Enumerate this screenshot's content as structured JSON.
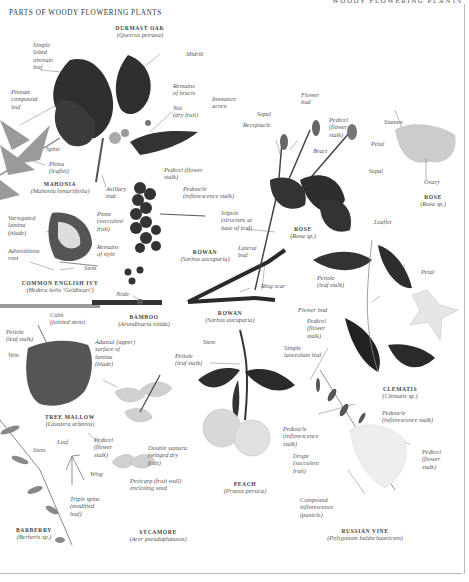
{
  "page": {
    "title": "PARTS OF WOODY FLOWERING PLANTS",
    "running_head": "WOODY FLOWERING PLANTS"
  },
  "specimens": [
    {
      "id": "oak",
      "name": "DURMAST OAK",
      "scientific": "(Quercus petraea)"
    },
    {
      "id": "mahonia",
      "name": "MAHONIA",
      "scientific": "(Mahonia lomariifolia)"
    },
    {
      "id": "ivy",
      "name": "COMMON ENGLISH IVY",
      "scientific": "(Hedera helix 'Goldheart')"
    },
    {
      "id": "bamboo",
      "name": "BAMBOO",
      "scientific": "(Arundinaria nitida)"
    },
    {
      "id": "rowan1",
      "name": "ROWAN",
      "scientific": "(Sorbus aucuparia)"
    },
    {
      "id": "rowan2",
      "name": "ROWAN",
      "scientific": "(Sorbus aucuparia)"
    },
    {
      "id": "rose1",
      "name": "ROSE",
      "scientific": "(Rosa sp.)"
    },
    {
      "id": "rose2",
      "name": "ROSE",
      "scientific": "(Rosa sp.)"
    },
    {
      "id": "mallow",
      "name": "TREE MALLOW",
      "scientific": "(Lavatera arborea)"
    },
    {
      "id": "sycamore",
      "name": "SYCAMORE",
      "scientific": "(Acer pseudoplatanus)"
    },
    {
      "id": "peach",
      "name": "PEACH",
      "scientific": "(Prunus persica)"
    },
    {
      "id": "clematis",
      "name": "CLEMATIS",
      "scientific": "(Clematis sp.)"
    },
    {
      "id": "barberry",
      "name": "BARBERRY",
      "scientific": "(Berberis sp.)"
    },
    {
      "id": "vine",
      "name": "RUSSIAN VINE",
      "scientific": "(Polygonum baldschuanicum)"
    }
  ],
  "labels": {
    "simple_lobed": "Simple\nlobed\nobovate\nleaf",
    "midrib": "Midrib",
    "remains_bracts": "Remains\nof bracts",
    "nut": "Nut\n(dry fruit)",
    "immature_acorn": "Immature\nacorn",
    "pinnate": "Pinnate\ncompound\nleaf",
    "spine": "Spine",
    "pinna": "Pinna\n(leaflet)",
    "axillary_bud": "Axillary\nbud",
    "pedicel_rowan": "Pedicel (flower\nstalk)",
    "peduncle_rowan": "Peduncle\n(inflorescence stalk)",
    "pome": "Pome\n(succulent\nfruit)",
    "remains_style": "Remains\nof style",
    "variegated": "Variegated\nlamina\n(blade)",
    "adventitious": "Adventitious\nroot",
    "stem_ivy": "Stem",
    "node": "Node",
    "culm": "Culm\n(jointed stem)",
    "stipule": "Stipule\n(structure at\nbase of leaf)",
    "sepal_rose": "Sepal",
    "receptacle": "Receptacle",
    "flower_bud_rose": "Flower\nbud",
    "pedicel_rose": "Pedicel\n(flower\nstalk)",
    "bract": "Bract",
    "leaflet": "Leaflet",
    "stamen": "Stamen",
    "petal_rose": "Petal",
    "sepal_rose2": "Sepal",
    "ovary": "Ovary",
    "lateral_bud": "Lateral\nbud",
    "ring_scar": "Ring scar",
    "petiole_clem": "Petiole\n(leaf stalk)",
    "petal_clem": "Petal",
    "flower_bud_clem": "Flower bud",
    "pedicel_clem": "Pedicel\n(flower\nstalk)",
    "simple_lanceolate": "Simple\nlanceolate leaf",
    "petiole_mallow": "Petiole\n(leaf stalk)",
    "vein": "Vein",
    "adaxial": "Adaxial (upper)\nsurface of\nlamina\n(blade)",
    "stem_peach": "Stem",
    "petiole_peach": "Petiole\n(leaf stalk)",
    "peduncle_peach": "Peduncle\n(inflorescence\nstalk)",
    "drupe": "Drupe\n(succulent\nfruit)",
    "peduncle_vine": "Peduncle\n(inflorescence stalk)",
    "pedicel_vine": "Pedicel\n(flower\nstalk)",
    "compound_infl": "Compound\ninflorescence\n(panicle)",
    "stem_barberry": "Stem",
    "leaf_barberry": "Leaf",
    "triple_spine": "Triple spine\n(modified\nleaf)",
    "pedicel_syc": "Pedicel\n(flower\nstalk)",
    "wing": "Wing",
    "double_samara": "Double samara\n(winged dry\nfruit)",
    "pericarp": "Pericarp (fruit wall)\nenclosing seed"
  },
  "colors": {
    "ink_dark": "#2a2a2a",
    "leaf_dark": "#3a3a3a",
    "leaf_mid": "#6a6a6a",
    "leaf_light": "#a8a8a8",
    "fruit_light": "#d8d8d8",
    "label_text": "#555555",
    "rule": "#bbbbbb"
  }
}
